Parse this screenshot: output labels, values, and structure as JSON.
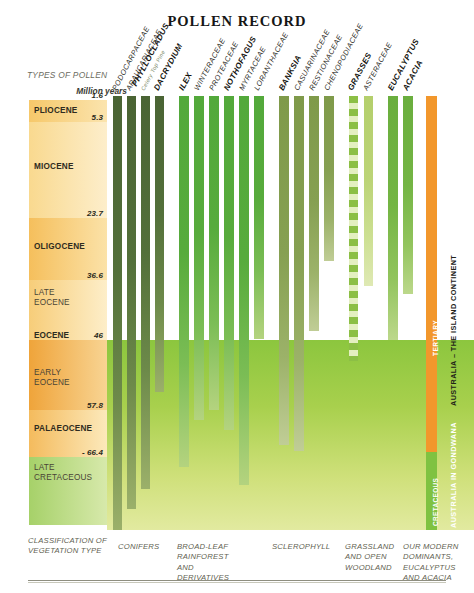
{
  "title": "POLLEN RECORD",
  "axis": {
    "types_of_pollen": "TYPES OF POLLEN",
    "million_years": "Million years"
  },
  "chart_data": {
    "type": "bar",
    "title": "POLLEN RECORD",
    "xlabel": "TYPES OF POLLEN",
    "ylabel": "Million years",
    "ylim": [
      0,
      70
    ],
    "grid": false,
    "legend": "none",
    "orientation": "vertical-range-bars",
    "note": "Each column is a pollen taxon; the bar spans the geological interval in which that pollen occurs, read downward from 1.6 Ma (top) to older than 66.4 Ma (bottom).",
    "epochs": [
      {
        "name": "PLIOCENE",
        "top_ma": 1.6,
        "base_ma": 5.3,
        "bold": true
      },
      {
        "name": "MIOCENE",
        "top_ma": 5.3,
        "base_ma": 23.7,
        "bold": true
      },
      {
        "name": "OLIGOCENE",
        "top_ma": 23.7,
        "base_ma": 36.6,
        "bold": true
      },
      {
        "name": "LATE EOCENE",
        "top_ma": 36.6,
        "base_ma": 46.0,
        "bold": false
      },
      {
        "name": "EARLY EOCENE",
        "top_ma": 46.0,
        "base_ma": 57.8,
        "bold": false
      },
      {
        "name": "PALAEOCENE",
        "top_ma": 57.8,
        "base_ma": 66.4,
        "bold": true
      },
      {
        "name": "LATE CRETACEOUS",
        "top_ma": 66.4,
        "base_ma": 75.0,
        "bold": false
      }
    ],
    "tick_labels": [
      "1.6",
      "5.3",
      "23.7",
      "36.6",
      "46",
      "57.8",
      "- 66.4"
    ],
    "eocene_label": "EOCENE",
    "categories": [
      "PODOCARPACEAE",
      "ARAUCARIACEAE",
      "PHYLLOCLADUS",
      "DACRYDIUM",
      "ILEX",
      "WINTERACEAE",
      "PROTEACEAE",
      "NOTHOFAGUS",
      "MYRTACEAE",
      "LORANTHACEAE",
      "BANKSIA",
      "CASUARINACEAE",
      "RESTIONACEAE",
      "CHENOPODIACEAE",
      "GRASSES",
      "ASTERACEAE",
      "EUCALYPTUS",
      "ACACIA"
    ],
    "series": [
      {
        "name": "PODOCARPACEAE",
        "start_ma": 1.6,
        "end_ma": 75.0
      },
      {
        "name": "ARAUCARIACEAE",
        "start_ma": 1.6,
        "end_ma": 72.0
      },
      {
        "name": "PHYLLOCLADUS",
        "start_ma": 1.6,
        "end_ma": 68.0
      },
      {
        "name": "DACRYDIUM",
        "start_ma": 1.6,
        "end_ma": 58.5
      },
      {
        "name": "ILEX",
        "start_ma": 1.6,
        "end_ma": 66.0
      },
      {
        "name": "WINTERACEAE",
        "start_ma": 1.6,
        "end_ma": 54.0
      },
      {
        "name": "PROTEACEAE",
        "start_ma": 1.6,
        "end_ma": 53.0
      },
      {
        "name": "NOTHOFAGUS",
        "start_ma": 1.6,
        "end_ma": 56.0
      },
      {
        "name": "MYRTACEAE",
        "start_ma": 1.6,
        "end_ma": 66.0
      },
      {
        "name": "LORANTHACEAE",
        "start_ma": 1.6,
        "end_ma": 45.0
      },
      {
        "name": "BANKSIA",
        "start_ma": 1.6,
        "end_ma": 60.0
      },
      {
        "name": "CASUARINACEAE",
        "start_ma": 1.6,
        "end_ma": 60.5
      },
      {
        "name": "RESTIONACEAE",
        "start_ma": 1.6,
        "end_ma": 44.0
      },
      {
        "name": "CHENOPODIACEAE",
        "start_ma": 1.6,
        "end_ma": 30.0
      },
      {
        "name": "GRASSES",
        "start_ma": 1.6,
        "end_ma": 57.0
      },
      {
        "name": "ASTERACEAE",
        "start_ma": 1.6,
        "end_ma": 36.0
      },
      {
        "name": "EUCALYPTUS",
        "start_ma": 1.6,
        "end_ma": 46.0
      },
      {
        "name": "ACACIA",
        "start_ma": 1.6,
        "end_ma": 37.0
      }
    ]
  },
  "columns": [
    {
      "label": "PODOCARPACEAE",
      "sub": "",
      "bold": false,
      "x": 6,
      "w": 9,
      "h": 434,
      "fill": "darkgreen",
      "group": 0
    },
    {
      "label": "ARAUCARIACEAE",
      "sub": "",
      "bold": false,
      "x": 20,
      "w": 9,
      "h": 413,
      "fill": "darkgreen",
      "group": 0
    },
    {
      "label": "PHYLLOCLADUS",
      "sub": "Celery Top Pine",
      "bold": true,
      "x": 34,
      "w": 9,
      "h": 393,
      "fill": "darkgreen",
      "group": 0
    },
    {
      "label": "DACRYDIUM",
      "sub": "",
      "bold": true,
      "x": 48,
      "w": 9,
      "h": 296,
      "fill": "darkgreen",
      "group": 0
    },
    {
      "label": "ILEX",
      "sub": "",
      "bold": true,
      "x": 72,
      "w": 10,
      "h": 371,
      "fill": "midgreen",
      "group": 1
    },
    {
      "label": "WINTERACEAE",
      "sub": "",
      "bold": false,
      "x": 87,
      "w": 10,
      "h": 324,
      "fill": "midgreen",
      "group": 1
    },
    {
      "label": "PROTEACEAE",
      "sub": "",
      "bold": false,
      "x": 102,
      "w": 10,
      "h": 314,
      "fill": "midgreen",
      "group": 1
    },
    {
      "label": "NOTHOFAGUS",
      "sub": "",
      "bold": true,
      "x": 117,
      "w": 10,
      "h": 334,
      "fill": "midgreen",
      "group": 1
    },
    {
      "label": "MYRTACEAE",
      "sub": "",
      "bold": false,
      "x": 132,
      "w": 10,
      "h": 389,
      "fill": "midgreen",
      "group": 1
    },
    {
      "label": "LORANTHACEAE",
      "sub": "",
      "bold": false,
      "x": 147,
      "w": 10,
      "h": 243,
      "fill": "midgreen",
      "group": 1
    },
    {
      "label": "BANKSIA",
      "sub": "",
      "bold": true,
      "x": 172,
      "w": 10,
      "h": 349,
      "fill": "olive",
      "group": 2
    },
    {
      "label": "CASUARINACEAE",
      "sub": "",
      "bold": false,
      "x": 187,
      "w": 10,
      "h": 355,
      "fill": "olive",
      "group": 2
    },
    {
      "label": "RESTIONACEAE",
      "sub": "",
      "bold": false,
      "x": 202,
      "w": 10,
      "h": 235,
      "fill": "olive",
      "group": 2
    },
    {
      "label": "CHENOPODIACEAE",
      "sub": "",
      "bold": false,
      "x": 217,
      "w": 10,
      "h": 165,
      "fill": "olive",
      "group": 2
    },
    {
      "label": "GRASSES",
      "sub": "",
      "bold": true,
      "x": 242,
      "w": 9,
      "h": 265,
      "fill": "dashed",
      "group": 3
    },
    {
      "label": "ASTERACEAE",
      "sub": "",
      "bold": false,
      "x": 257,
      "w": 9,
      "h": 190,
      "fill": "ltgreen",
      "group": 3
    },
    {
      "label": "EUCALYPTUS",
      "sub": "",
      "bold": true,
      "x": 281,
      "w": 10,
      "h": 244,
      "fill": "midgreen2",
      "group": 4
    },
    {
      "label": "ACACIA",
      "sub": "",
      "bold": true,
      "x": 296,
      "w": 10,
      "h": 198,
      "fill": "midgreen2",
      "group": 4
    }
  ],
  "continent": {
    "tertiary_label": "TERTIARY",
    "tertiary_color": "#f2972c",
    "cretaceous_label": "CRETACEOUS",
    "cretaceous_color": "#7fc241",
    "island_label": "AUSTRALIA – THE ISLAND CONTINENT",
    "gondwana_label": "AUSTRALIA IN GONDWANA"
  },
  "classification": {
    "heading": "CLASSIFICATION OF\nVEGETATION TYPE",
    "groups": [
      {
        "text": "CONIFERS",
        "x": 118
      },
      {
        "text": "BROAD-LEAF\nRAINFOREST AND\nDERIVATIVES",
        "x": 177
      },
      {
        "text": "SCLEROPHYLL",
        "x": 272
      },
      {
        "text": "GRASSLAND\nAND OPEN\nWOODLAND",
        "x": 345
      },
      {
        "text": "OUR MODERN\nDOMINANTS,\nEUCALYPTUS\nAND ACACIA",
        "x": 403
      }
    ]
  }
}
